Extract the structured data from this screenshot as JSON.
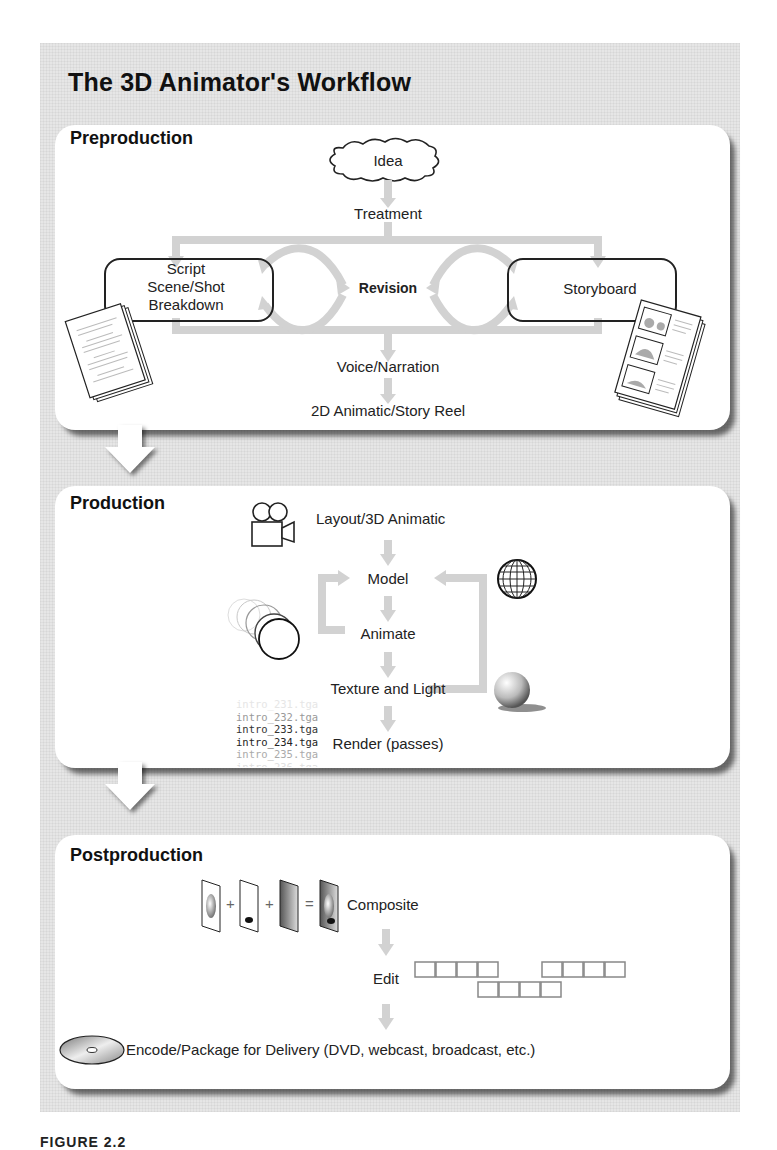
{
  "title": "The 3D Animator's Workflow",
  "caption": "FIGURE 2.2",
  "colors": {
    "background": "#e6e6e6",
    "panel": "#ffffff",
    "arrow": "#cfcfcf",
    "outline": "#222222"
  },
  "preproduction": {
    "heading": "Preproduction",
    "idea": "Idea",
    "treatment": "Treatment",
    "script_lines": [
      "Script",
      "Scene/Shot",
      "Breakdown"
    ],
    "revision": "Revision",
    "storyboard": "Storyboard",
    "voice": "Voice/Narration",
    "animatic": "2D Animatic/Story Reel",
    "icons": [
      "cloud-icon",
      "script-pages-icon",
      "storyboard-pages-icon"
    ]
  },
  "production": {
    "heading": "Production",
    "layout": "Layout/3D Animatic",
    "model": "Model",
    "animate": "Animate",
    "texture": "Texture and Light",
    "render": "Render (passes)",
    "files": [
      "intro_231.tga",
      "intro_232.tga",
      "intro_233.tga",
      "intro_234.tga",
      "intro_235.tga",
      "intro_236.tga"
    ],
    "icons": [
      "movie-camera-icon",
      "bouncing-ball-icon",
      "wireframe-sphere-icon",
      "shaded-sphere-icon"
    ]
  },
  "postproduction": {
    "heading": "Postproduction",
    "composite": "Composite",
    "edit": "Edit",
    "encode": "Encode/Package for Delivery (DVD, webcast, broadcast, etc.)",
    "operators": [
      "+",
      "+",
      "="
    ],
    "icons": [
      "layer-stack-icon",
      "film-strip-icon",
      "disc-icon"
    ]
  }
}
